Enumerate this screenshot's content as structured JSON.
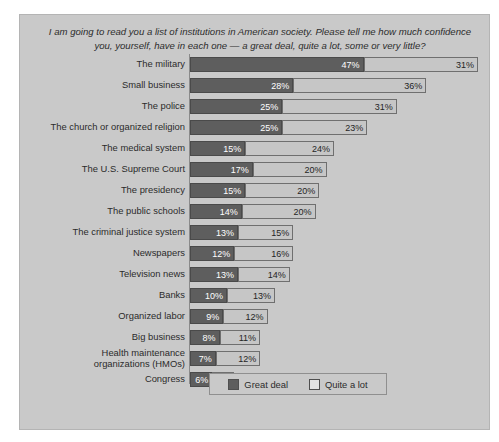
{
  "panel": {
    "background_color": "#c9c9c9",
    "border_color": "#b4b4b4"
  },
  "title": {
    "text": "I am going to read you a list of institutions in American society. Please tell me how much confidence you, yourself, have in each one — a great deal, quite a lot, some or very little?"
  },
  "legend": {
    "position": "bottom-center",
    "items": [
      {
        "label": "Great deal",
        "color": "#5e5e5e"
      },
      {
        "label": "Quite a lot",
        "color": "#e3e3e3"
      }
    ]
  },
  "chart_data": {
    "type": "bar",
    "orientation": "horizontal",
    "stacked": true,
    "title": "I am going to read you a list of institutions in American society. Please tell me how much confidence you, yourself, have in each one — a great deal, quite a lot, some or very little?",
    "xlabel": "",
    "ylabel": "",
    "xlim": [
      0,
      78
    ],
    "grid": false,
    "value_suffix": "%",
    "categories": [
      "The military",
      "Small business",
      "The police",
      "The church or organized religion",
      "The medical system",
      "The U.S. Supreme Court",
      "The presidency",
      "The public schools",
      "The criminal justice system",
      "Newspapers",
      "Television news",
      "Banks",
      "Organized labor",
      "Big business",
      "Health maintenance organizations (HMOs)",
      "Congress"
    ],
    "series": [
      {
        "name": "Great deal",
        "color": "#5e5e5e",
        "values": [
          47,
          28,
          25,
          25,
          15,
          17,
          15,
          14,
          13,
          12,
          13,
          10,
          9,
          8,
          7,
          6
        ]
      },
      {
        "name": "Quite a lot",
        "color": "#c6c6c6",
        "values": [
          31,
          36,
          31,
          23,
          24,
          20,
          20,
          20,
          15,
          16,
          14,
          13,
          12,
          11,
          12,
          6
        ]
      }
    ],
    "labels": [
      {
        "category": "The military",
        "great_deal": "47%",
        "quite_a_lot": "31%"
      },
      {
        "category": "Small business",
        "great_deal": "28%",
        "quite_a_lot": "36%"
      },
      {
        "category": "The police",
        "great_deal": "25%",
        "quite_a_lot": "31%"
      },
      {
        "category": "The church or organized religion",
        "great_deal": "25%",
        "quite_a_lot": "23%"
      },
      {
        "category": "The medical system",
        "great_deal": "15%",
        "quite_a_lot": "24%"
      },
      {
        "category": "The U.S. Supreme Court",
        "great_deal": "17%",
        "quite_a_lot": "20%"
      },
      {
        "category": "The presidency",
        "great_deal": "15%",
        "quite_a_lot": "20%"
      },
      {
        "category": "The public schools",
        "great_deal": "14%",
        "quite_a_lot": "20%"
      },
      {
        "category": "The criminal justice system",
        "great_deal": "13%",
        "quite_a_lot": "15%"
      },
      {
        "category": "Newspapers",
        "great_deal": "12%",
        "quite_a_lot": "16%"
      },
      {
        "category": "Television news",
        "great_deal": "13%",
        "quite_a_lot": "14%"
      },
      {
        "category": "Banks",
        "great_deal": "10%",
        "quite_a_lot": "13%"
      },
      {
        "category": "Organized labor",
        "great_deal": "9%",
        "quite_a_lot": "12%"
      },
      {
        "category": "Big business",
        "great_deal": "8%",
        "quite_a_lot": "11%"
      },
      {
        "category": "Health maintenance organizations (HMOs)",
        "great_deal": "7%",
        "quite_a_lot": "12%"
      },
      {
        "category": "Congress",
        "great_deal": "6%",
        "quite_a_lot": "6%"
      }
    ]
  }
}
